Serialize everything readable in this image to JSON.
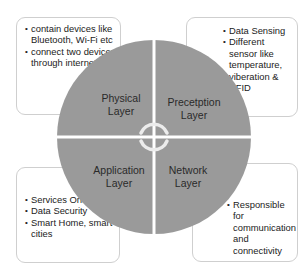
{
  "diagram": {
    "colors": {
      "quadrant_fill": "#9a9a9a",
      "divider": "#ffffff",
      "box_border": "#cfcfcf",
      "text": "#222222"
    },
    "center_icon": "circular-arrows-icon",
    "quadrants": [
      {
        "position": "top-left",
        "title_line1": "Physical",
        "title_line2": "Layer"
      },
      {
        "position": "top-right",
        "title_line1": "Precetption",
        "title_line2": "Layer"
      },
      {
        "position": "bottom-left",
        "title_line1": "Application",
        "title_line2": "Layer"
      },
      {
        "position": "bottom-right",
        "title_line1": "Network",
        "title_line2": "Layer"
      }
    ],
    "boxes": {
      "physical": [
        "contain devices like Bluetooth, Wi-Fi etc",
        "connect two devices through internet"
      ],
      "perception": [
        "Data Sensing",
        "Different sensor like temperature, viberation & RFID"
      ],
      "application": [
        "Services Oriented",
        "Data Security",
        "Smart Home, smart cities"
      ],
      "network": [
        "Responsible for communication and connectivity"
      ]
    }
  }
}
